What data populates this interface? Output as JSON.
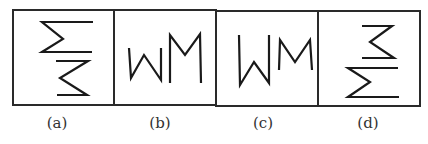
{
  "figure": {
    "stroke_color": "#1a1a1a",
    "frame_color": "#2a2a2a",
    "label_color": "#333333",
    "options": [
      {
        "id": "a",
        "label": "(a)",
        "label_x": 57,
        "box": {
          "x": 13,
          "y": 10,
          "w": 101,
          "h": 95
        },
        "strokes": [
          "93,22 42,22 63,39 42,52 92,52",
          "56,61 88,61 60,78 87,95 57,95"
        ]
      },
      {
        "id": "b",
        "label": "(b)",
        "label_x": 160,
        "box": {
          "x": 114,
          "y": 10,
          "w": 102,
          "h": 95
        },
        "strokes": [
          "129,48 131,78 144,55 161,80 161,48",
          "170,83 170,35 185,55 200,34 201,83"
        ]
      },
      {
        "id": "c",
        "label": "(c)",
        "label_x": 263,
        "box": {
          "x": 216,
          "y": 11,
          "w": 102,
          "h": 95
        },
        "strokes": [
          "239,35 240,85 254,62 269,83 269,35",
          "279,70 280,40 295,62 310,40 312,70"
        ]
      },
      {
        "id": "d",
        "label": "(d)",
        "label_x": 368,
        "box": {
          "x": 318,
          "y": 11,
          "w": 102,
          "h": 95
        },
        "strokes": [
          "362,26 392,26 370,42 394,58 362,58",
          "398,68 348,68 370,82 348,97 399,97"
        ]
      }
    ]
  }
}
